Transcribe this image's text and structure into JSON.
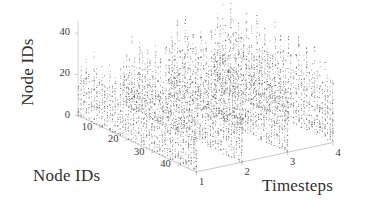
{
  "figure": {
    "background": "#ffffff",
    "ink_color": "#3a3a38",
    "point_color": "#4a4a4a",
    "axis_line_color": "#cfcfcb"
  },
  "axes": {
    "vertical": {
      "title": "Node IDs",
      "ticks": [
        "40",
        "20",
        "0"
      ],
      "tick_values": [
        40,
        20,
        0
      ],
      "range": [
        0,
        46
      ]
    },
    "depth": {
      "title": "Node IDs",
      "ticks": [
        "10",
        "20",
        "30",
        "40"
      ],
      "tick_values": [
        10,
        20,
        30,
        40
      ],
      "range": [
        1,
        46
      ]
    },
    "horizontal": {
      "title": "Timesteps",
      "ticks": [
        "1",
        "2",
        "3",
        "4"
      ],
      "tick_values": [
        1,
        2,
        3,
        4
      ],
      "range": [
        1,
        4
      ]
    }
  },
  "chart_data": {
    "type": "scatter",
    "title": "",
    "subtitle": "",
    "xlabel": "Timesteps",
    "ylabel": "Node IDs",
    "zlabel": "Node IDs",
    "projection": "3d",
    "grid": false,
    "legend": null,
    "xlim": [
      1,
      4
    ],
    "ylim": [
      1,
      46
    ],
    "zlim": [
      0,
      46
    ],
    "xticks": [
      1,
      2,
      3,
      4
    ],
    "yticks": [
      10,
      20,
      30,
      40
    ],
    "zticks": [
      0,
      20,
      40
    ],
    "marker": {
      "shape": "dot",
      "size": 1,
      "color": "#4a4a4a"
    },
    "panels": [
      {
        "timestep": 1,
        "columns": 46,
        "column_heights": [
          18,
          27,
          22,
          31,
          24,
          20,
          35,
          28,
          23,
          30,
          26,
          21,
          33,
          25,
          29,
          19,
          34,
          27,
          22,
          31,
          24,
          28,
          20,
          36,
          23,
          30,
          25,
          21,
          32,
          26,
          18,
          29,
          34,
          22,
          27,
          31,
          20,
          25,
          33,
          23,
          28,
          19,
          30,
          24,
          26,
          21
        ]
      },
      {
        "timestep": 2,
        "columns": 46,
        "column_heights": [
          22,
          30,
          25,
          36,
          27,
          23,
          38,
          31,
          26,
          33,
          29,
          24,
          37,
          28,
          32,
          21,
          39,
          30,
          25,
          35,
          27,
          31,
          23,
          40,
          26,
          34,
          28,
          24,
          36,
          29,
          21,
          32,
          38,
          25,
          30,
          35,
          23,
          28,
          37,
          26,
          31,
          22,
          33,
          27,
          29,
          24
        ]
      },
      {
        "timestep": 3,
        "columns": 46,
        "column_heights": [
          25,
          33,
          28,
          39,
          30,
          26,
          41,
          34,
          29,
          36,
          32,
          27,
          40,
          31,
          35,
          24,
          42,
          33,
          28,
          38,
          30,
          34,
          26,
          43,
          29,
          37,
          31,
          27,
          39,
          32,
          24,
          35,
          41,
          28,
          33,
          38,
          26,
          31,
          40,
          29,
          34,
          25,
          36,
          30,
          32,
          27
        ]
      },
      {
        "timestep": 4,
        "columns": 46,
        "column_heights": [
          28,
          36,
          31,
          42,
          33,
          29,
          44,
          37,
          32,
          39,
          35,
          30,
          43,
          34,
          38,
          27,
          45,
          36,
          31,
          41,
          33,
          37,
          29,
          46,
          32,
          40,
          34,
          30,
          42,
          35,
          27,
          38,
          44,
          31,
          36,
          41,
          29,
          34,
          43,
          32,
          37,
          28,
          39,
          33,
          35,
          30
        ]
      }
    ]
  }
}
